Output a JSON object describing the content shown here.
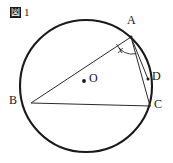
{
  "figure": {
    "caption_glyph": "図",
    "caption_glyph_name": "zu-kanji-figure-marker",
    "caption_number": "1",
    "ink_color": "#1a1a1a",
    "background_color": "#ffffff",
    "circle": {
      "center_label": "O",
      "center_dot_label": "center-dot",
      "cx": 86,
      "cy": 86,
      "r": 66,
      "stroke_width": 2.0
    },
    "points": [
      {
        "id": "A",
        "label": "A",
        "x": 131,
        "y": 37,
        "label_x": 131,
        "label_y": 21
      },
      {
        "id": "B",
        "label": "B",
        "x": 31,
        "y": 103,
        "label_x": 12,
        "label_y": 98
      },
      {
        "id": "C",
        "label": "C",
        "x": 150,
        "y": 106,
        "label_x": 153,
        "label_y": 100
      },
      {
        "id": "D",
        "label": "D",
        "x": 148,
        "y": 79,
        "label_x": 152,
        "label_y": 73
      },
      {
        "id": "O",
        "label": "O",
        "x": 84,
        "y": 81,
        "label_x": 90,
        "label_y": 71
      }
    ],
    "segments": [
      {
        "id": "BA",
        "from": "B",
        "to": "A",
        "name": "segment-b-a"
      },
      {
        "id": "BC",
        "from": "B",
        "to": "C",
        "name": "segment-b-c"
      },
      {
        "id": "AC",
        "from": "A",
        "to": "C",
        "name": "segment-a-c"
      },
      {
        "id": "AD",
        "from": "A",
        "to": "D",
        "name": "segment-a-d"
      }
    ],
    "angle": {
      "label": "x",
      "vertex": "A",
      "label_x": 120,
      "label_y": 44,
      "arc_radius": 17
    }
  }
}
